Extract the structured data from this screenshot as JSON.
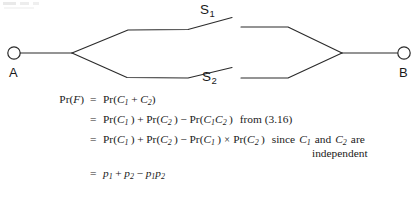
{
  "figure": {
    "type": "reliability-block-diagram",
    "nodes": [
      {
        "id": "A",
        "label": "A",
        "shape": "circle",
        "x": 14,
        "y": 53
      },
      {
        "id": "B",
        "label": "B",
        "shape": "circle",
        "x": 404,
        "y": 53
      }
    ],
    "junctions": [
      {
        "id": "left-junction",
        "x": 72,
        "y": 53
      },
      {
        "id": "right-junction",
        "x": 342,
        "y": 53
      }
    ],
    "branches": [
      {
        "id": "S1",
        "label": "S",
        "subscript": "1",
        "position": "upper"
      },
      {
        "id": "S2",
        "label": "S",
        "subscript": "2",
        "position": "lower"
      }
    ]
  },
  "equations": {
    "line1": {
      "lhs_pr": "Pr",
      "lhs_arg": "F",
      "equals": "=",
      "rhs_pr": "Pr",
      "rhs_c1": "C",
      "rhs_c1_sub": "1",
      "plus": "+",
      "rhs_c2": "C",
      "rhs_c2_sub": "2"
    },
    "line2": {
      "equals": "=",
      "pr": "Pr",
      "c": "C",
      "sub1": "1",
      "sub2": "2",
      "plus": "+",
      "minus": "−",
      "note": "from (3.16)"
    },
    "line3": {
      "equals": "=",
      "pr": "Pr",
      "c": "C",
      "sub1": "1",
      "sub2": "2",
      "plus": "+",
      "minus": "−",
      "times": "×",
      "since": "since",
      "and": "and",
      "are": "are"
    },
    "line4": {
      "equals": "=",
      "p": "p",
      "sub1": "1",
      "sub2": "2",
      "plus": "+",
      "minus": "−"
    },
    "independent": "independent"
  },
  "colors": {
    "ink": "#1a1a1a",
    "line": "#2b2b2b",
    "background": "#ffffff"
  }
}
